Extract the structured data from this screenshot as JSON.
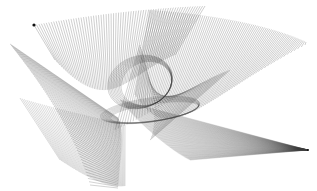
{
  "image": {
    "title": "String art ruled-surface drawing",
    "width": 317,
    "height": 191,
    "background": "#ffffff",
    "stroke_color": "#3a3a3a"
  },
  "families": [
    {
      "name": "top-fan",
      "count": 70,
      "opacity": 0.55,
      "width": 0.45,
      "edgeA": [
        [
          34,
          25
        ],
        [
          90,
          15
        ],
        [
          150,
          8
        ],
        [
          205,
          6
        ]
      ],
      "edgeB": [
        [
          55,
          60
        ],
        [
          110,
          120
        ],
        [
          125,
          75
        ],
        [
          175,
          55
        ]
      ]
    },
    {
      "name": "right-horn",
      "count": 85,
      "opacity": 0.55,
      "width": 0.45,
      "edgeA": [
        [
          150,
          10
        ],
        [
          210,
          14
        ],
        [
          270,
          25
        ],
        [
          306,
          42
        ]
      ],
      "edgeB": [
        [
          135,
          95
        ],
        [
          170,
          150
        ],
        [
          200,
          100
        ],
        [
          305,
          45
        ]
      ]
    },
    {
      "name": "left-wedge",
      "count": 60,
      "opacity": 0.5,
      "width": 0.45,
      "edgeA": [
        [
          10,
          44
        ],
        [
          30,
          70
        ],
        [
          70,
          120
        ],
        [
          90,
          185
        ]
      ],
      "edgeB": [
        [
          118,
          118
        ],
        [
          125,
          130
        ],
        [
          120,
          160
        ],
        [
          118,
          188
        ]
      ]
    },
    {
      "name": "bottom-right-fan",
      "count": 75,
      "opacity": 0.4,
      "width": 0.4,
      "edgeA": [
        [
          120,
          100
        ],
        [
          140,
          125
        ],
        [
          170,
          150
        ],
        [
          190,
          160
        ]
      ],
      "edgeB": [
        [
          308,
          150
        ],
        [
          308,
          150
        ],
        [
          308,
          150
        ],
        [
          308,
          150
        ]
      ]
    },
    {
      "name": "lower-left-fan",
      "count": 55,
      "opacity": 0.45,
      "width": 0.4,
      "edgeA": [
        [
          20,
          98
        ],
        [
          60,
          110
        ],
        [
          100,
          118
        ],
        [
          125,
          125
        ]
      ],
      "edgeB": [
        [
          60,
          160
        ],
        [
          90,
          180
        ],
        [
          110,
          188
        ],
        [
          125,
          186
        ]
      ]
    },
    {
      "name": "center-cross",
      "count": 45,
      "opacity": 0.5,
      "width": 0.45,
      "edgeA": [
        [
          115,
          130
        ],
        [
          160,
          110
        ],
        [
          200,
          80
        ],
        [
          230,
          70
        ]
      ],
      "edgeB": [
        [
          140,
          45
        ],
        [
          150,
          75
        ],
        [
          160,
          120
        ],
        [
          150,
          140
        ]
      ]
    }
  ],
  "loops": [
    {
      "cx": 140,
      "cy": 82,
      "rx": 33,
      "ry": 26,
      "rot": -20,
      "count": 10,
      "opacity": 0.45
    },
    {
      "cx": 150,
      "cy": 110,
      "rx": 50,
      "ry": 12,
      "rot": -8,
      "count": 8,
      "opacity": 0.4
    }
  ],
  "markers": [
    {
      "x": 34,
      "y": 25,
      "r": 1.6
    },
    {
      "x": 308,
      "y": 150,
      "r": 1.0
    }
  ]
}
